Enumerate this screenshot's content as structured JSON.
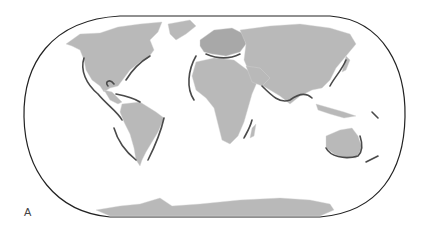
{
  "figure": {
    "panel_label": "A",
    "projection": "world map (pseudo-cylindrical, rounded frame)",
    "colors": {
      "land": "#b9b9b9",
      "land_border": "#d9d9d9",
      "frame": "#222222",
      "coastal_outline": "#4a4a4a",
      "highlight_region": "#8f8f8f",
      "background": "#ffffff"
    },
    "regions_shown": [
      "North America",
      "South America",
      "Europe",
      "Africa",
      "Asia",
      "Australia",
      "Antarctica"
    ]
  }
}
